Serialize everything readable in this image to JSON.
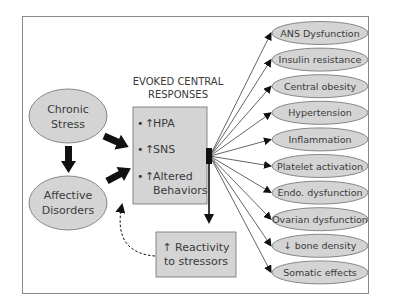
{
  "figure": {
    "sources": [
      {
        "id": "chronic-stress",
        "lines": [
          "Chronic",
          "Stress"
        ]
      },
      {
        "id": "affective-disorders",
        "lines": [
          "Affective",
          "Disorders"
        ]
      }
    ],
    "central": {
      "title_lines": [
        "EVOKED CENTRAL",
        "RESPONSES"
      ],
      "items": [
        {
          "bullet": "•",
          "arrow": "↑",
          "lines": [
            "HPA"
          ]
        },
        {
          "bullet": "•",
          "arrow": "↑",
          "lines": [
            "SNS"
          ]
        },
        {
          "bullet": "•",
          "arrow": "↑",
          "lines": [
            "Altered",
            "Behaviors"
          ]
        }
      ]
    },
    "reactivity": {
      "lines": [
        "↑ Reactivity",
        "to stressors"
      ]
    },
    "outcomes": [
      "ANS Dysfunction",
      "Insulin resistance",
      "Central obesity",
      "Hypertension",
      "Inflammation",
      "Platelet activation",
      "Endo. dysfunction",
      "Ovarian dysfunction",
      "↓ bone density",
      "Somatic effects"
    ],
    "colors": {
      "node_fill": "#d4d4d4",
      "node_stroke": "#6e6e6e",
      "arrow": "#111111",
      "text": "#3a3a3a",
      "frame": "#8a8a8a"
    }
  }
}
